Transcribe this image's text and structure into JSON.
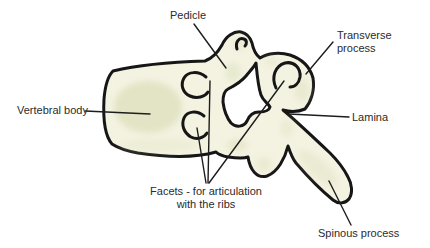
{
  "diagram": {
    "type": "anatomical-line-drawing",
    "subject_labels": [
      "Pedicle",
      "Transverse process",
      "Vertebral body",
      "Lamina",
      "Facets - for articulation with the ribs",
      "Spinous process"
    ]
  },
  "labels": {
    "pedicle": "Pedicle",
    "transverse_process": "Transverse process",
    "vertebral_body": "Vertebral body",
    "lamina": "Lamina",
    "facets": "Facets - for articulation\nwith the ribs",
    "spinous_process": "Spinous process"
  },
  "colors": {
    "background": "#ffffff",
    "bone_fill": "#f4f3e2",
    "bone_shading": "#dfe1c0",
    "outline": "#161616",
    "leader_line": "#1d1d1d",
    "label_text": "#2b2b2b"
  }
}
